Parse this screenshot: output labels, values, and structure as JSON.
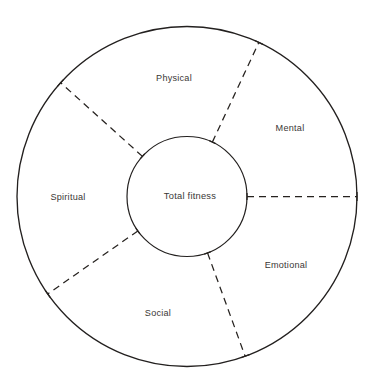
{
  "diagram": {
    "type": "segmented-circle",
    "center": {
      "x": 187,
      "y": 196.5
    },
    "outer_radius": 170,
    "inner_radius": 60,
    "stroke_color": "#23201f",
    "divider_color": "#26221f",
    "background_color": "#ffffff",
    "hub": {
      "label": "Total fitness",
      "label_x": 190,
      "label_y": 196
    },
    "segments": [
      {
        "id": "physical",
        "label": "Physical",
        "label_x": 174,
        "label_y": 78,
        "start_deg": 65,
        "end_deg": 138
      },
      {
        "id": "mental",
        "label": "Mental",
        "label_x": 290,
        "label_y": 128,
        "start_deg": 0,
        "end_deg": 65
      },
      {
        "id": "emotional",
        "label": "Emotional",
        "label_x": 286,
        "label_y": 265,
        "start_deg": -70,
        "end_deg": 0
      },
      {
        "id": "social",
        "label": "Social",
        "label_x": 158,
        "label_y": 313,
        "start_deg": -145,
        "end_deg": -70
      },
      {
        "id": "spiritual",
        "label": "Spiritual",
        "label_x": 68,
        "label_y": 197,
        "start_deg": 138,
        "end_deg": 215
      }
    ],
    "dividers": [
      {
        "id": "divider-spiritual-physical",
        "angle_deg": 138
      },
      {
        "id": "divider-physical-mental",
        "angle_deg": 65
      },
      {
        "id": "divider-mental-emotional",
        "angle_deg": 0
      },
      {
        "id": "divider-emotional-social",
        "angle_deg": -70
      },
      {
        "id": "divider-social-spiritual",
        "angle_deg": -145
      }
    ]
  }
}
